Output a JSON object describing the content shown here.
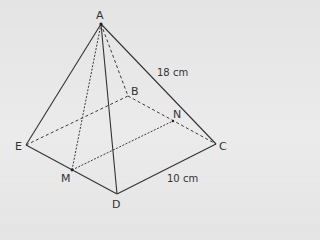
{
  "diagram": {
    "type": "square-based pyramid",
    "points": {
      "A": {
        "label": "A",
        "x": 101,
        "y": 24
      },
      "B": {
        "label": "B",
        "x": 128,
        "y": 96
      },
      "C": {
        "label": "C",
        "x": 216,
        "y": 144
      },
      "D": {
        "label": "D",
        "x": 117,
        "y": 194
      },
      "E": {
        "label": "E",
        "x": 26,
        "y": 145
      },
      "M": {
        "label": "M",
        "x": 72,
        "y": 170
      },
      "N": {
        "label": "N",
        "x": 173,
        "y": 121
      }
    },
    "measurements": {
      "edge_AC": "18 cm",
      "edge_DC": "10 cm"
    },
    "colors": {
      "line": "#333333",
      "background": "#e6e6e6"
    }
  }
}
